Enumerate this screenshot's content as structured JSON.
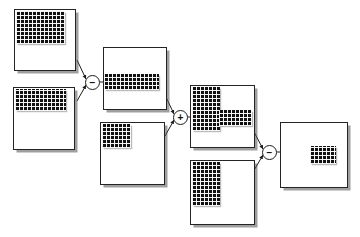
{
  "diagram": {
    "canvas": {
      "width": 360,
      "height": 237,
      "background": "#ffffff"
    },
    "style": {
      "card_fill": "#ffffff",
      "card_stroke": "#242424",
      "patch_fill": "#111111",
      "patch_grid": "#ffffff",
      "shadow": "#505050",
      "operator_stroke": "#1c1c1c",
      "wire_stroke": "#1c1c1c"
    },
    "nodes": [
      {
        "id": "input-1",
        "name": "input-image-top-left",
        "role": "input",
        "x": 14,
        "y": 9,
        "w": 62,
        "h": 62,
        "patches": [
          {
            "name": "region-top-left-block",
            "x": 1,
            "y": 1,
            "w": 49,
            "h": 33
          }
        ]
      },
      {
        "id": "input-2",
        "name": "input-image-bottom-left",
        "role": "input",
        "x": 13,
        "y": 87,
        "w": 62,
        "h": 63,
        "patches": [
          {
            "name": "region-top-band",
            "x": 1,
            "y": 1,
            "w": 51,
            "h": 22
          }
        ]
      },
      {
        "id": "inter-1",
        "name": "intermediate-image-upper",
        "role": "intermediate",
        "x": 103,
        "y": 47,
        "w": 64,
        "h": 63,
        "patches": [
          {
            "name": "region-middle-band",
            "x": 0,
            "y": 26,
            "w": 55,
            "h": 16
          }
        ]
      },
      {
        "id": "input-3",
        "name": "input-image-middle-lower",
        "role": "input",
        "x": 100,
        "y": 122,
        "w": 65,
        "h": 63,
        "patches": [
          {
            "name": "region-top-left-square",
            "x": 1,
            "y": 1,
            "w": 29,
            "h": 24
          }
        ]
      },
      {
        "id": "inter-2",
        "name": "intermediate-image-lshape",
        "role": "intermediate",
        "x": 190,
        "y": 85,
        "w": 65,
        "h": 63,
        "patches": [
          {
            "name": "region-left-column",
            "x": 1,
            "y": 1,
            "w": 28,
            "h": 44
          },
          {
            "name": "region-middle-band-right",
            "x": 28,
            "y": 24,
            "w": 33,
            "h": 16
          }
        ]
      },
      {
        "id": "input-4",
        "name": "input-image-bottom-right",
        "role": "input",
        "x": 190,
        "y": 160,
        "w": 65,
        "h": 65,
        "patches": [
          {
            "name": "region-left-column",
            "x": 1,
            "y": 1,
            "w": 28,
            "h": 44
          }
        ]
      },
      {
        "id": "result",
        "name": "result-image",
        "role": "output",
        "x": 280,
        "y": 122,
        "w": 68,
        "h": 66,
        "patches": [
          {
            "name": "region-center-rect",
            "x": 29,
            "y": 23,
            "w": 26,
            "h": 18
          }
        ]
      }
    ],
    "operators": [
      {
        "id": "op-1",
        "name": "subtract-operator-1",
        "symbol": "−",
        "label": "minus",
        "x": 85,
        "y": 75
      },
      {
        "id": "op-2",
        "name": "add-operator",
        "symbol": "+",
        "label": "plus",
        "x": 173,
        "y": 110
      },
      {
        "id": "op-3",
        "name": "subtract-operator-2",
        "symbol": "−",
        "label": "minus",
        "x": 262,
        "y": 145
      }
    ],
    "edges": [
      {
        "name": "edge-input1-to-op1",
        "from": "input-1",
        "to": "op-1",
        "x1": 77,
        "y1": 60,
        "x2": 86,
        "y2": 79
      },
      {
        "name": "edge-input2-to-op1",
        "from": "input-2",
        "to": "op-1",
        "x1": 77,
        "y1": 101,
        "x2": 86,
        "y2": 85
      },
      {
        "name": "edge-op1-to-inter1",
        "from": "op-1",
        "to": "inter-1",
        "x1": 100,
        "y1": 82,
        "x2": 112,
        "y2": 82
      },
      {
        "name": "edge-inter1-to-op2",
        "from": "inter-1",
        "to": "op-2",
        "x1": 165,
        "y1": 95,
        "x2": 174,
        "y2": 114
      },
      {
        "name": "edge-input3-to-op2",
        "from": "input-3",
        "to": "op-2",
        "x1": 165,
        "y1": 136,
        "x2": 174,
        "y2": 120
      },
      {
        "name": "edge-op2-to-inter2",
        "from": "op-2",
        "to": "inter-2",
        "x1": 188,
        "y1": 117,
        "x2": 198,
        "y2": 117
      },
      {
        "name": "edge-inter2-to-op3",
        "from": "inter-2",
        "to": "op-3",
        "x1": 253,
        "y1": 130,
        "x2": 263,
        "y2": 149
      },
      {
        "name": "edge-input4-to-op3",
        "from": "input-4",
        "to": "op-3",
        "x1": 253,
        "y1": 172,
        "x2": 263,
        "y2": 155
      },
      {
        "name": "edge-op3-to-result",
        "from": "op-3",
        "to": "result",
        "x1": 277,
        "y1": 152,
        "x2": 288,
        "y2": 152
      }
    ]
  }
}
